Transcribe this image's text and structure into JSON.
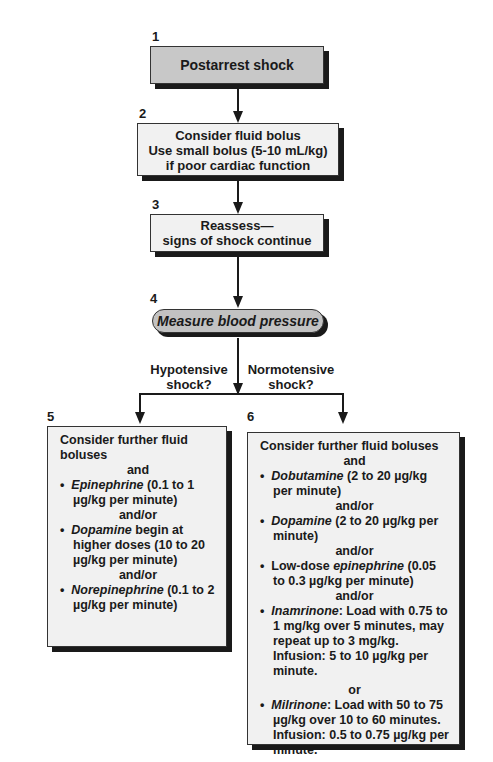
{
  "steps": {
    "s1": {
      "number": "1",
      "text": "Postarrest shock"
    },
    "s2": {
      "number": "2",
      "lines": [
        "Consider fluid bolus",
        "Use small bolus (5-10 mL/kg)",
        "if poor cardiac function"
      ]
    },
    "s3": {
      "number": "3",
      "lines": [
        "Reassess—",
        "signs of shock continue"
      ]
    },
    "s4": {
      "number": "4",
      "text": "Measure blood pressure"
    }
  },
  "branches": {
    "left_label": [
      "Hypotensive",
      "shock?"
    ],
    "right_label": [
      "Normotensive",
      "shock?"
    ]
  },
  "panel5": {
    "number": "5",
    "intro": "Consider further fluid boluses",
    "and": "and",
    "items": [
      {
        "bullet": "•",
        "drug": "Epinephrine",
        "rest": " (0.1 to 1 µg/kg per minute)"
      },
      {
        "connector": "and/or"
      },
      {
        "bullet": "•",
        "drug": "Dopamine",
        "rest": " begin at higher doses (10 to 20 µg/kg per minute)"
      },
      {
        "connector": "and/or"
      },
      {
        "bullet": "•",
        "drug": "Norepinephrine",
        "rest": " (0.1 to 2 µg/kg per minute)"
      }
    ]
  },
  "panel6": {
    "number": "6",
    "intro": "Consider further fluid boluses",
    "and": "and",
    "items": [
      {
        "bullet": "•",
        "drug": "Dobutamine",
        "rest": " (2 to 20 µg/kg per minute)"
      },
      {
        "connector": "and/or"
      },
      {
        "bullet": "•",
        "drug": "Dopamine",
        "rest": " (2 to 20 µg/kg per minute)"
      },
      {
        "connector": "and/or"
      },
      {
        "bullet": "•",
        "prefix": "Low-dose ",
        "drug": "epinephrine",
        "rest": " (0.05 to 0.3 µg/kg per minute)"
      },
      {
        "connector": "and/or"
      },
      {
        "bullet": "•",
        "drug": "Inamrinone",
        "rest": ": Load with 0.75 to 1 mg/kg over 5 minutes, may repeat up to 3 mg/kg. Infusion: 5 to 10 µg/kg per minute."
      },
      {
        "connector": "or"
      },
      {
        "bullet": "•",
        "drug": "Milrinone",
        "rest": ": Load with 50 to 75 µg/kg over 10 to 60 minutes. Infusion: 0.5 to 0.75 µg/kg per minute."
      }
    ]
  },
  "colors": {
    "gray_box": "#c8c8c8",
    "light_box": "#f1f1f1",
    "pill": "#c2c2c2",
    "shadow": "#1a1a1a"
  }
}
